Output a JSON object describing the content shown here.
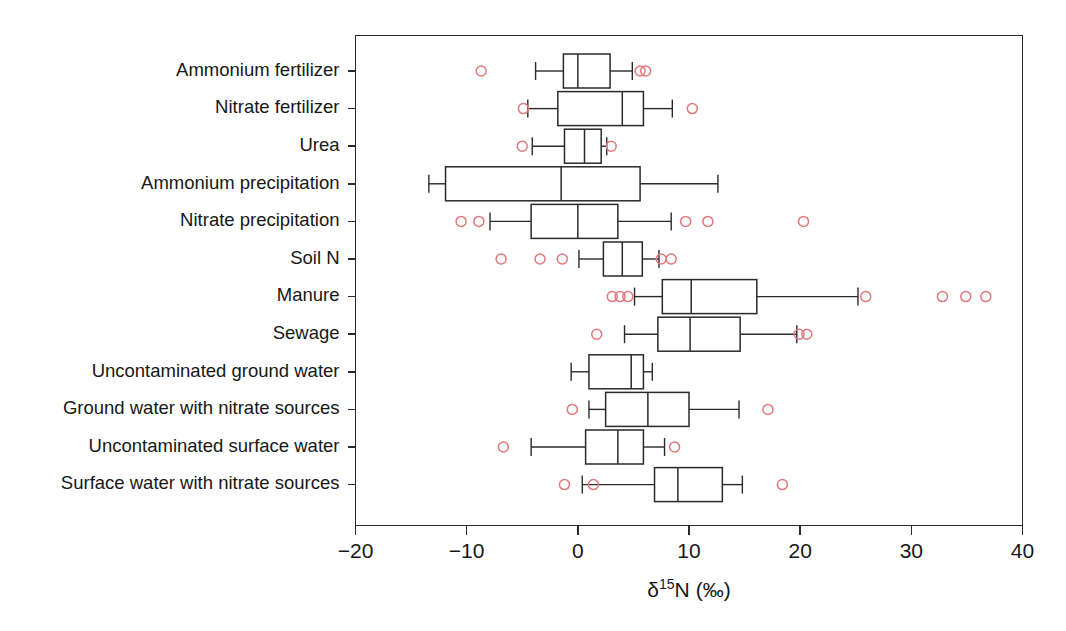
{
  "chart_data": {
    "type": "box",
    "title": "",
    "xlabel": "δ15N (‰)",
    "xlabel_parts": {
      "delta": "δ",
      "superscript": "15",
      "element": "N",
      "units": "(‰)"
    },
    "ylabel": "",
    "xlim": [
      -20,
      40
    ],
    "xticks": [
      -20,
      -10,
      0,
      10,
      20,
      30,
      40
    ],
    "xticklabels": [
      "−20",
      "−10",
      "0",
      "10",
      "20",
      "30",
      "40"
    ],
    "grid": false,
    "legend": false,
    "orientation": "horizontal",
    "outlier_color": "#e2787d",
    "box_color": "#2a2a2a",
    "categories": [
      "Ammonium fertilizer",
      "Nitrate fertilizer",
      "Urea",
      "Ammonium precipitation",
      "Nitrate precipitation",
      "Soil N",
      "Manure",
      "Sewage",
      "Uncontaminated ground water",
      "Ground water with nitrate sources",
      "Uncontaminated surface water",
      "Surface water with nitrate sources"
    ],
    "boxes": [
      {
        "category": "Ammonium fertilizer",
        "whisker_low": -3.8,
        "q1": -1.3,
        "median": 0.0,
        "q3": 2.9,
        "whisker_high": 4.9,
        "outliers": [
          -8.7,
          5.6,
          6.1
        ]
      },
      {
        "category": "Nitrate fertilizer",
        "whisker_low": -4.5,
        "q1": -1.8,
        "median": 4.0,
        "q3": 5.9,
        "whisker_high": 8.5,
        "outliers": [
          -4.9,
          10.3
        ]
      },
      {
        "category": "Urea",
        "whisker_low": -4.1,
        "q1": -1.2,
        "median": 0.6,
        "q3": 2.1,
        "whisker_high": 2.6,
        "outliers": [
          -5.0,
          3.0
        ]
      },
      {
        "category": "Ammonium precipitation",
        "whisker_low": -13.4,
        "q1": -11.9,
        "median": -1.5,
        "q3": 5.6,
        "whisker_high": 12.6,
        "outliers": []
      },
      {
        "category": "Nitrate precipitation",
        "whisker_low": -7.9,
        "q1": -4.2,
        "median": 0.0,
        "q3": 3.6,
        "whisker_high": 8.4,
        "outliers": [
          -10.5,
          -8.9,
          9.7,
          11.7,
          20.3
        ]
      },
      {
        "category": "Soil N",
        "whisker_low": 0.1,
        "q1": 2.3,
        "median": 4.0,
        "q3": 5.8,
        "whisker_high": 7.3,
        "outliers": [
          -6.9,
          -3.4,
          -1.4,
          7.5,
          8.4
        ]
      },
      {
        "category": "Manure",
        "whisker_low": 5.1,
        "q1": 7.6,
        "median": 10.2,
        "q3": 16.1,
        "whisker_high": 25.2,
        "outliers": [
          3.1,
          3.8,
          4.5,
          25.9,
          32.8,
          34.9,
          36.7
        ]
      },
      {
        "category": "Sewage",
        "whisker_low": 4.2,
        "q1": 7.2,
        "median": 10.1,
        "q3": 14.6,
        "whisker_high": 19.7,
        "outliers": [
          1.7,
          19.9,
          20.6
        ]
      },
      {
        "category": "Uncontaminated ground water",
        "whisker_low": -0.6,
        "q1": 1.0,
        "median": 4.8,
        "q3": 5.9,
        "whisker_high": 6.7,
        "outliers": []
      },
      {
        "category": "Ground water with nitrate sources",
        "whisker_low": 1.0,
        "q1": 2.5,
        "median": 6.3,
        "q3": 10.0,
        "whisker_high": 14.5,
        "outliers": [
          -0.5,
          17.1
        ]
      },
      {
        "category": "Uncontaminated surface water",
        "whisker_low": -4.2,
        "q1": 0.7,
        "median": 3.6,
        "q3": 5.9,
        "whisker_high": 7.8,
        "outliers": [
          -6.7,
          8.7
        ]
      },
      {
        "category": "Surface water with nitrate sources",
        "whisker_low": 0.4,
        "q1": 6.9,
        "median": 9.0,
        "q3": 13.0,
        "whisker_high": 14.8,
        "outliers": [
          -1.2,
          1.4,
          18.4
        ]
      }
    ]
  },
  "axis": {
    "x_title_delta": "δ",
    "x_title_sup": "15",
    "x_title_elem": "N",
    "x_title_units": "(‰)"
  }
}
